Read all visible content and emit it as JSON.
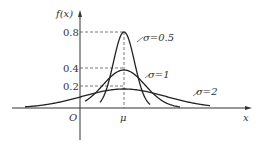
{
  "chart_data": {
    "type": "line",
    "title": "",
    "xlabel": "x",
    "ylabel": "f(x)",
    "origin_label": "O",
    "mean_label": "μ",
    "yticks": [
      "0.8",
      "0.4",
      "0.2"
    ],
    "series": [
      {
        "name": "σ=0.5",
        "sigma": 0.5,
        "peak": 0.8
      },
      {
        "name": "σ=1",
        "sigma": 1,
        "peak": 0.4
      },
      {
        "name": "σ=2",
        "sigma": 2,
        "peak": 0.2
      }
    ],
    "grid": false,
    "dashed_guides": true
  },
  "labels": {
    "ylabel": "f(x)",
    "xlabel": "x",
    "origin": "O",
    "mu": "μ",
    "y08": "0.8",
    "y04": "0.4",
    "y02": "0.2",
    "s05": "σ=0.5",
    "s1": "σ=1",
    "s2": "σ=2"
  }
}
